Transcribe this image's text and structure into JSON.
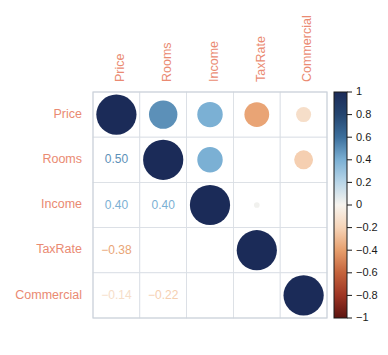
{
  "chart_data": {
    "type": "heatmap",
    "subtype": "correlation-matrix-with-circles",
    "title": "",
    "xlabel": "",
    "ylabel": "",
    "categories": [
      "Price",
      "Rooms",
      "Income",
      "TaxRate",
      "Commercial"
    ],
    "row_labels": [
      "Price",
      "Rooms",
      "Income",
      "TaxRate",
      "Commercial"
    ],
    "col_labels": [
      "Price",
      "Rooms",
      "Income",
      "TaxRate",
      "Commercial"
    ],
    "matrix": [
      [
        1.0,
        0.5,
        0.4,
        -0.38,
        -0.14
      ],
      [
        0.5,
        1.0,
        0.4,
        0.0,
        -0.22
      ],
      [
        0.4,
        0.4,
        1.0,
        0.02,
        0.0
      ],
      [
        -0.38,
        0.0,
        0.02,
        1.0,
        0.0
      ],
      [
        -0.14,
        -0.22,
        0.0,
        0.0,
        1.0
      ]
    ],
    "upper_triangle_display": "circles",
    "lower_triangle_display": "numbers",
    "diagonal_display": "circles",
    "cells": [
      {
        "row": "Price",
        "col": "Price",
        "value": 1.0,
        "display": "circle",
        "label": ""
      },
      {
        "row": "Price",
        "col": "Rooms",
        "value": 0.5,
        "display": "circle",
        "label": ""
      },
      {
        "row": "Price",
        "col": "Income",
        "value": 0.4,
        "display": "circle",
        "label": ""
      },
      {
        "row": "Price",
        "col": "TaxRate",
        "value": -0.38,
        "display": "circle",
        "label": ""
      },
      {
        "row": "Price",
        "col": "Commercial",
        "value": -0.14,
        "display": "circle",
        "label": ""
      },
      {
        "row": "Rooms",
        "col": "Price",
        "value": 0.5,
        "display": "number",
        "label": "0.50"
      },
      {
        "row": "Rooms",
        "col": "Rooms",
        "value": 1.0,
        "display": "circle",
        "label": ""
      },
      {
        "row": "Rooms",
        "col": "Income",
        "value": 0.4,
        "display": "circle",
        "label": ""
      },
      {
        "row": "Rooms",
        "col": "TaxRate",
        "value": 0.0,
        "display": "circle",
        "label": ""
      },
      {
        "row": "Rooms",
        "col": "Commercial",
        "value": -0.22,
        "display": "circle",
        "label": ""
      },
      {
        "row": "Income",
        "col": "Price",
        "value": 0.4,
        "display": "number",
        "label": "0.40"
      },
      {
        "row": "Income",
        "col": "Rooms",
        "value": 0.4,
        "display": "number",
        "label": "0.40"
      },
      {
        "row": "Income",
        "col": "Income",
        "value": 1.0,
        "display": "circle",
        "label": ""
      },
      {
        "row": "Income",
        "col": "TaxRate",
        "value": 0.02,
        "display": "circle",
        "label": ""
      },
      {
        "row": "Income",
        "col": "Commercial",
        "value": 0.0,
        "display": "circle",
        "label": ""
      },
      {
        "row": "TaxRate",
        "col": "Price",
        "value": -0.38,
        "display": "number",
        "label": "−0.38"
      },
      {
        "row": "TaxRate",
        "col": "Rooms",
        "value": 0.0,
        "display": "number",
        "label": ""
      },
      {
        "row": "TaxRate",
        "col": "Income",
        "value": 0.02,
        "display": "number",
        "label": ""
      },
      {
        "row": "TaxRate",
        "col": "TaxRate",
        "value": 1.0,
        "display": "circle",
        "label": ""
      },
      {
        "row": "TaxRate",
        "col": "Commercial",
        "value": 0.0,
        "display": "circle",
        "label": ""
      },
      {
        "row": "Commercial",
        "col": "Price",
        "value": -0.14,
        "display": "number",
        "label": "−0.14"
      },
      {
        "row": "Commercial",
        "col": "Rooms",
        "value": -0.22,
        "display": "number",
        "label": "−0.22"
      },
      {
        "row": "Commercial",
        "col": "Income",
        "value": 0.0,
        "display": "number",
        "label": ""
      },
      {
        "row": "Commercial",
        "col": "TaxRate",
        "value": 0.0,
        "display": "number",
        "label": ""
      },
      {
        "row": "Commercial",
        "col": "Commercial",
        "value": 1.0,
        "display": "circle",
        "label": ""
      }
    ],
    "colorbar": {
      "ticks": [
        "1",
        "0.8",
        "0.6",
        "0.4",
        "0.2",
        "0",
        "−0.2",
        "−0.4",
        "−0.6",
        "−0.8",
        "−1"
      ],
      "tick_values": [
        1,
        0.8,
        0.6,
        0.4,
        0.2,
        0,
        -0.2,
        -0.4,
        -0.6,
        -0.8,
        -1
      ],
      "range": [
        -1,
        1
      ],
      "position": "right",
      "colormap": "RdBu_reversed",
      "stops": [
        {
          "value": 1.0,
          "color": "#1b2b58"
        },
        {
          "value": 0.8,
          "color": "#24456f"
        },
        {
          "value": 0.6,
          "color": "#3c6f9c"
        },
        {
          "value": 0.4,
          "color": "#7bb0d4"
        },
        {
          "value": 0.2,
          "color": "#b9d6e8"
        },
        {
          "value": 0.0,
          "color": "#f7f4ef"
        },
        {
          "value": -0.2,
          "color": "#f6d4b8"
        },
        {
          "value": -0.4,
          "color": "#e79f6d"
        },
        {
          "value": -0.6,
          "color": "#c4633c"
        },
        {
          "value": -0.8,
          "color": "#9e3524"
        },
        {
          "value": -1.0,
          "color": "#5c1410"
        }
      ]
    },
    "grid": true,
    "legend_position": "right",
    "label_color": "#ea8a72",
    "grid_line_color": "#d8dde3",
    "background_color": "#ffffff"
  }
}
